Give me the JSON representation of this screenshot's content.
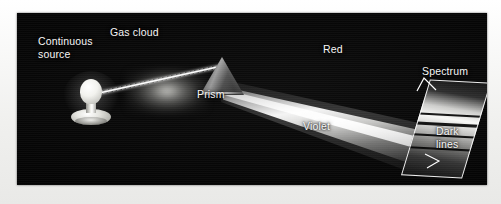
{
  "figure": {
    "background_color": "#050505",
    "page_color": "#f4f4f2",
    "label_color": "#f6f6f6"
  },
  "labels": {
    "continuous_source": "Continuous\nsource",
    "gas_cloud": "Gas cloud",
    "prism": "Prism",
    "red": "Red",
    "violet": "Violet",
    "spectrum": "Spectrum",
    "dark_lines": "Dark\nlines"
  },
  "components": {
    "light_source": "light-bulb",
    "cloud": "gas-cloud",
    "disperser": "prism",
    "detector": "spectrum-screen"
  },
  "spectrum_screen": {
    "dark_line_count": 4,
    "dark_line_offsets_percent": [
      34,
      44,
      56,
      70
    ]
  }
}
